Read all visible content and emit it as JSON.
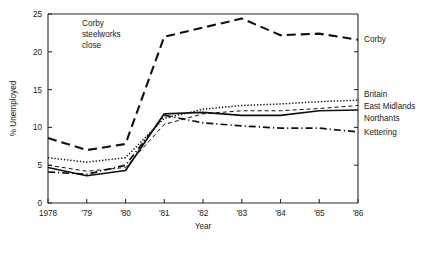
{
  "chart_data": {
    "type": "line",
    "title": "",
    "xlabel": "Year",
    "ylabel": "% Unemployed",
    "grid": false,
    "legend_position": "right-of-axis-inline",
    "x": [
      1978,
      1979,
      1980,
      1981,
      1982,
      1983,
      1984,
      1985,
      1986
    ],
    "xtick_labels": [
      "1978",
      "'79",
      "'80",
      "'81",
      "'82",
      "'83",
      "'84",
      "'85",
      "'86"
    ],
    "ytick_labels": [
      "0",
      "5",
      "10",
      "15",
      "20",
      "25"
    ],
    "ytick_values": [
      0,
      5,
      10,
      15,
      20,
      25
    ],
    "ylim": [
      0,
      25
    ],
    "xlim": [
      1978,
      1986
    ],
    "annotations": [
      {
        "text": "Corby steelworks close",
        "lines": [
          "Corby",
          "steelworks",
          "close"
        ],
        "x": 1979.6,
        "y": 22.2
      }
    ],
    "series": [
      {
        "name": "Corby",
        "label": "Corby",
        "style": "long-dash",
        "dash": "9 5",
        "width": 2.1,
        "color": "#111111",
        "values": [
          8.6,
          7.0,
          7.8,
          22.0,
          23.2,
          24.4,
          22.2,
          22.4,
          21.6
        ]
      },
      {
        "name": "Britain",
        "label": "Britain",
        "style": "dotted",
        "dash": "1.3 1.9",
        "width": 1.5,
        "color": "#111111",
        "values": [
          6.0,
          5.4,
          6.0,
          11.2,
          12.4,
          12.9,
          13.1,
          13.4,
          13.6
        ]
      },
      {
        "name": "East Midlands",
        "label": "East Midlands",
        "style": "short-dash",
        "dash": "4 3",
        "width": 1.0,
        "color": "#111111",
        "values": [
          5.0,
          4.2,
          4.7,
          10.4,
          11.8,
          12.2,
          12.2,
          12.5,
          12.9
        ]
      },
      {
        "name": "Northants",
        "label": "Northants",
        "style": "solid",
        "dash": "0",
        "width": 1.7,
        "color": "#111111",
        "values": [
          4.7,
          3.6,
          4.3,
          11.8,
          12.0,
          11.6,
          11.6,
          12.2,
          12.3
        ]
      },
      {
        "name": "Kettering",
        "label": "Kettering",
        "style": "dash-dot",
        "dash": "7 3 1.2 3",
        "width": 1.7,
        "color": "#111111",
        "values": [
          4.1,
          3.8,
          5.0,
          11.6,
          10.6,
          10.2,
          9.9,
          9.9,
          9.4
        ]
      }
    ]
  },
  "labels": {
    "corby": "Corby",
    "britain": "Britain",
    "east_midlands": "East Midlands",
    "northants": "Northants",
    "kettering": "Kettering"
  },
  "annotation_text": {
    "line1": "Corby",
    "line2": "steelworks",
    "line3": "close"
  },
  "axis": {
    "x_title": "Year",
    "y_title": "% Unemployed"
  }
}
